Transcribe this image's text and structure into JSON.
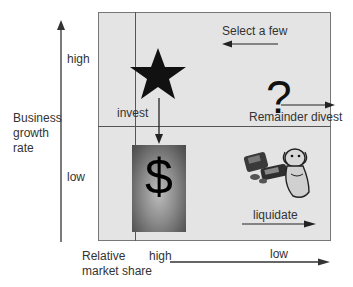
{
  "diagram": {
    "type": "BCG growth-share matrix",
    "y_axis": {
      "label": "Business growth rate",
      "label_lines": [
        "Business",
        "growth",
        "rate"
      ],
      "high": "high",
      "low": "low"
    },
    "x_axis": {
      "label": "Relative market share",
      "label_lines": [
        "Relative",
        "market share"
      ],
      "high": "high",
      "low": "low"
    },
    "quadrants": {
      "top_left": {
        "icon": "star-icon",
        "action": "invest"
      },
      "top_right": {
        "icon": "question-mark-icon",
        "symbol": "?",
        "actions": [
          "Select a few",
          "Remainder divest"
        ]
      },
      "bottom_left": {
        "icon": "cash-cow-icon",
        "symbol": "$"
      },
      "bottom_right": {
        "icon": "dog-icon",
        "action": "liquidate"
      }
    },
    "colors": {
      "grid_bg": "#e4e4e4",
      "lines": "#555555",
      "text": "#333333"
    }
  }
}
